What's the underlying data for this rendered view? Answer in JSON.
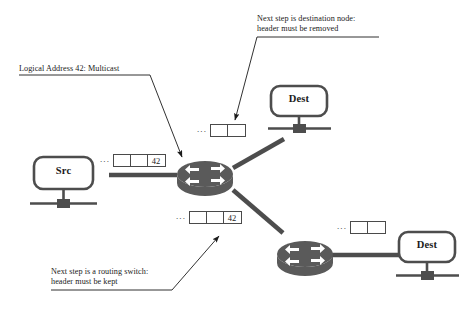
{
  "diagram": {
    "annotations": [
      {
        "name": "annotation-destination-node",
        "line1": "Next step is destination node:",
        "line2": "header must be removed"
      },
      {
        "name": "annotation-logical-address",
        "line1": "Logical Address 42: Multicast",
        "line2": ""
      },
      {
        "name": "annotation-routing-switch",
        "line1": "Next step is a routing switch:",
        "line2": "header must be kept"
      }
    ],
    "nodes": [
      {
        "name": "node-src",
        "label": "Src",
        "type": "host"
      },
      {
        "name": "node-dest-top",
        "label": "Dest",
        "type": "host"
      },
      {
        "name": "node-dest-bottom",
        "label": "Dest",
        "type": "host"
      },
      {
        "name": "router-left",
        "label": "",
        "type": "router"
      },
      {
        "name": "router-right",
        "label": "",
        "type": "router"
      }
    ],
    "packets": [
      {
        "name": "packet-src-to-router",
        "ellipsis": "...",
        "cells": [
          "",
          "",
          "42"
        ]
      },
      {
        "name": "packet-router-to-dest-top",
        "ellipsis": "...",
        "cells": [
          "",
          ""
        ]
      },
      {
        "name": "packet-router-to-router",
        "ellipsis": "...",
        "cells": [
          "",
          "",
          "42"
        ]
      },
      {
        "name": "packet-router-to-dest-bottom",
        "ellipsis": "...",
        "cells": [
          "",
          ""
        ]
      }
    ],
    "colors": {
      "ink": "#1a1a1a",
      "device": "#4d4d4d",
      "link": "#4d4d4d",
      "box_border": "#4a4a4a",
      "background": "#ffffff"
    }
  }
}
